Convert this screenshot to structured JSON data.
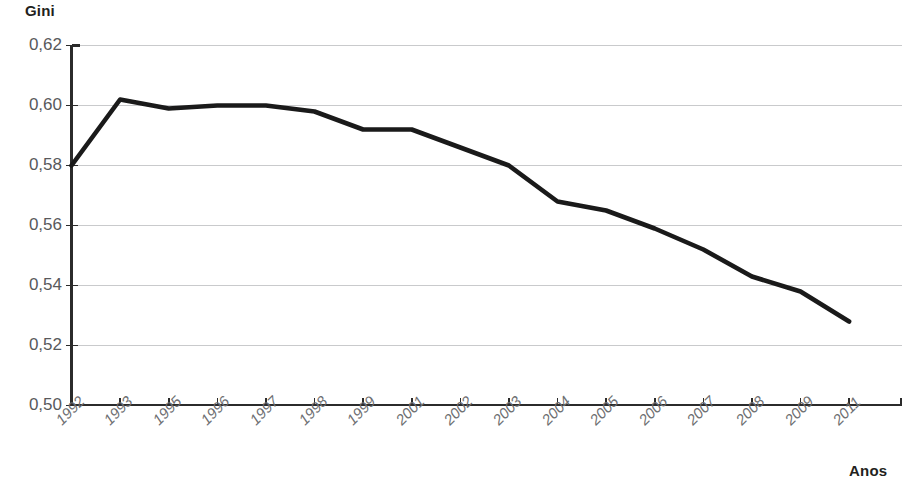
{
  "chart_data": {
    "type": "line",
    "title": "",
    "subtitle": "",
    "xlabel": "Anos",
    "ylabel": "Gini",
    "categories": [
      "1992",
      "1993",
      "1995",
      "1996",
      "1997",
      "1998",
      "1999",
      "2001",
      "2002",
      "2003",
      "2004",
      "2005",
      "2006",
      "2007",
      "2008",
      "2009",
      "2011"
    ],
    "series": [
      {
        "name": "Gini",
        "values": [
          0.58,
          0.602,
          0.599,
          0.6,
          0.6,
          0.598,
          0.592,
          0.592,
          0.586,
          0.58,
          0.568,
          0.565,
          0.559,
          0.552,
          0.543,
          0.538,
          0.528
        ]
      }
    ],
    "ylim": [
      0.5,
      0.62
    ],
    "ytick_labels": [
      "0,62",
      "0,60",
      "0,58",
      "0,56",
      "0,54",
      "0,52",
      "0,50"
    ],
    "ytick_values": [
      0.62,
      0.6,
      0.58,
      0.56,
      0.54,
      0.52,
      0.5
    ],
    "grid": true,
    "grid_axis": "y",
    "legend": false,
    "legend_position": "none",
    "annotations": [],
    "colors": {
      "line": "#1a1a1a",
      "grid": "#c9cacc",
      "axis": "#2b2b2b",
      "ytick_text": "#58595b",
      "xtick_text": "#6d6e71",
      "title_text": "#231f20",
      "background": "#ffffff"
    }
  }
}
